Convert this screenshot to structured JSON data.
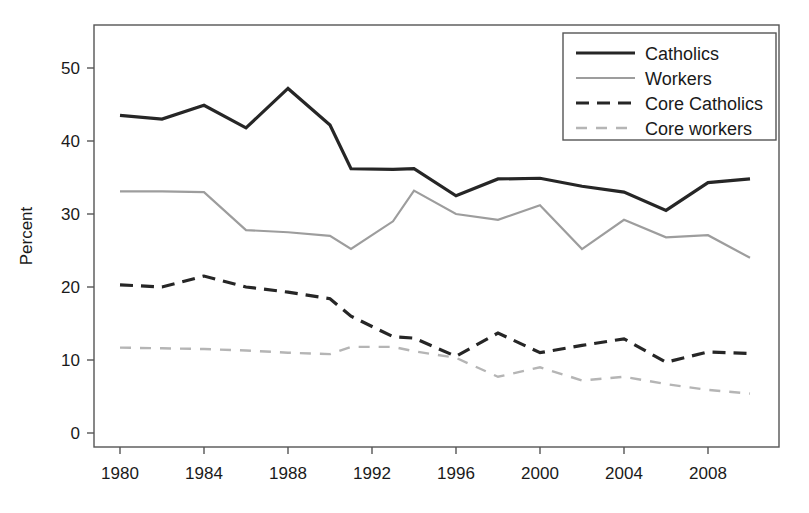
{
  "chart_data": {
    "type": "line",
    "title": "",
    "xlabel": "",
    "ylabel": "Percent",
    "xlim": [
      1979,
      1911
    ],
    "ylim": [
      0,
      55
    ],
    "grid": false,
    "legend_position": "top-right",
    "x_ticks": [
      1980,
      1984,
      1988,
      1992,
      1996,
      2000,
      2004,
      2008
    ],
    "y_ticks": [
      0,
      10,
      20,
      30,
      40,
      50
    ],
    "x": [
      1980,
      1982,
      1984,
      1986,
      1988,
      1990,
      1991,
      1993,
      1994,
      1996,
      1998,
      2000,
      2002,
      2004,
      2006,
      2008,
      2010
    ],
    "series": [
      {
        "name": "Catholics",
        "color": "#262626",
        "style": "solid",
        "width": 3.2,
        "values": [
          43.5,
          43.0,
          44.9,
          41.8,
          47.2,
          42.2,
          36.2,
          36.1,
          36.2,
          32.5,
          34.8,
          34.9,
          33.8,
          33.0,
          30.5,
          34.3,
          34.8
        ]
      },
      {
        "name": "Workers",
        "color": "#9d9d9d",
        "style": "solid",
        "width": 2.2,
        "values": [
          33.1,
          33.1,
          33.0,
          27.8,
          27.5,
          27.0,
          25.2,
          29.0,
          33.2,
          30.0,
          29.2,
          31.2,
          25.2,
          29.2,
          26.8,
          27.1,
          24.0
        ]
      },
      {
        "name": "Core Catholics",
        "color": "#262626",
        "style": "dashed",
        "width": 3.2,
        "values": [
          20.3,
          20.0,
          21.5,
          20.0,
          19.3,
          18.4,
          16.0,
          13.2,
          13.0,
          10.5,
          13.7,
          11.0,
          12.0,
          12.9,
          9.7,
          11.1,
          10.9
        ]
      },
      {
        "name": "Core workers",
        "color": "#b5b5b5",
        "style": "dashed",
        "width": 2.4,
        "values": [
          11.7,
          11.6,
          11.5,
          11.3,
          11.0,
          10.8,
          11.8,
          11.8,
          11.2,
          10.3,
          7.7,
          9.0,
          7.2,
          7.7,
          6.7,
          5.9,
          5.4
        ]
      }
    ]
  },
  "legend": {
    "items": [
      {
        "label": "Catholics"
      },
      {
        "label": "Workers"
      },
      {
        "label": "Core Catholics"
      },
      {
        "label": "Core workers"
      }
    ]
  },
  "axes": {
    "y_title": "Percent",
    "y_tick_labels": [
      "50",
      "40",
      "30",
      "20",
      "10",
      "0"
    ],
    "x_tick_labels": [
      "1980",
      "1984",
      "1988",
      "1992",
      "1996",
      "2000",
      "2004",
      "2008"
    ]
  }
}
